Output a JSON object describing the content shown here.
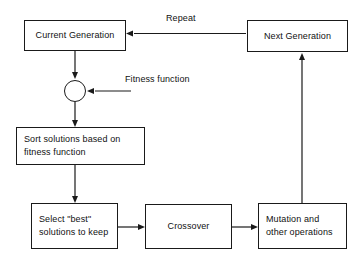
{
  "diagram": {
    "type": "flowchart",
    "canvas": {
      "width": 363,
      "height": 267,
      "background": "#ffffff"
    },
    "stroke_color": "#1a1a1a",
    "text_color": "#111111",
    "nodes": [
      {
        "id": "current_generation",
        "shape": "rectangle",
        "lines": [
          "Current Generation"
        ],
        "x": 24,
        "y": 20,
        "width": 102,
        "height": 31
      },
      {
        "id": "next_generation",
        "shape": "rectangle",
        "lines": [
          "Next Generation"
        ],
        "x": 247,
        "y": 20,
        "width": 101,
        "height": 32
      },
      {
        "id": "merge_point",
        "shape": "circle",
        "lines": [],
        "x": 64,
        "y": 80,
        "width": 22,
        "height": 22
      },
      {
        "id": "sort_solutions",
        "shape": "rectangle",
        "lines": [
          "Sort solutions based on",
          "fitness function"
        ],
        "x": 16,
        "y": 127,
        "width": 129,
        "height": 38
      },
      {
        "id": "select_best",
        "shape": "rectangle",
        "lines": [
          "Select \"best\"",
          "solutions to keep"
        ],
        "x": 31,
        "y": 203,
        "width": 87,
        "height": 46
      },
      {
        "id": "crossover",
        "shape": "rectangle",
        "lines": [
          "Crossover"
        ],
        "x": 145,
        "y": 204,
        "width": 87,
        "height": 45
      },
      {
        "id": "mutation",
        "shape": "rectangle",
        "lines": [
          "Mutation and",
          "other operations"
        ],
        "x": 258,
        "y": 203,
        "width": 89,
        "height": 46
      }
    ],
    "labels": [
      {
        "id": "repeat_label",
        "text": "Repeat",
        "x": 166,
        "y": 12
      },
      {
        "id": "fitness_function_label",
        "text": "Fitness function",
        "x": 125,
        "y": 73
      }
    ],
    "edges": [
      {
        "id": "next-to-current",
        "from": "next_generation",
        "to": "current_generation",
        "label": "Repeat"
      },
      {
        "id": "current-to-merge",
        "from": "current_generation",
        "to": "merge_point",
        "label": ""
      },
      {
        "id": "fitness-into-merge",
        "from": "fitness_function_label",
        "to": "merge_point",
        "label": "Fitness function"
      },
      {
        "id": "merge-to-sort",
        "from": "merge_point",
        "to": "sort_solutions",
        "label": ""
      },
      {
        "id": "sort-to-select",
        "from": "sort_solutions",
        "to": "select_best",
        "label": ""
      },
      {
        "id": "select-to-crossover",
        "from": "select_best",
        "to": "crossover",
        "label": ""
      },
      {
        "id": "crossover-to-mutation",
        "from": "crossover",
        "to": "mutation",
        "label": ""
      },
      {
        "id": "mutation-to-next",
        "from": "mutation",
        "to": "next_generation",
        "label": ""
      }
    ]
  }
}
